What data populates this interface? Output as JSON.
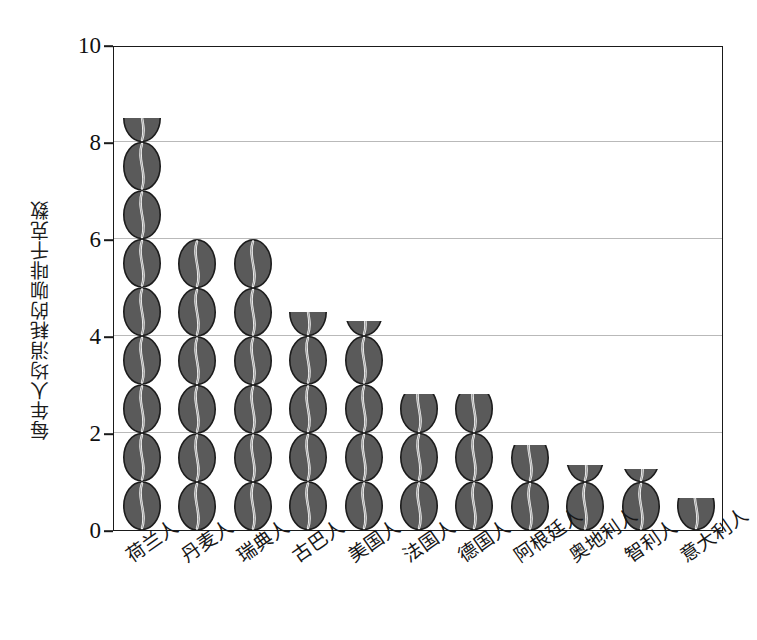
{
  "chart_data": {
    "type": "bar",
    "title": "",
    "xlabel": "",
    "ylabel": "每年人均消耗的咖啡千克数",
    "ylim": [
      0,
      10
    ],
    "ytick_labels": [
      "0",
      "2",
      "4",
      "6",
      "8",
      "10"
    ],
    "ytick_values": [
      0,
      2,
      4,
      6,
      8,
      10
    ],
    "gridlines": [
      2,
      4,
      6,
      8
    ],
    "grid": true,
    "legend": "none",
    "bar_style": "coffee-bean-pictogram",
    "unit_note": "每颗咖啡豆代表1千克",
    "categories": [
      "荷兰人",
      "丹麦人",
      "瑞典人",
      "古巴人",
      "美国人",
      "法国人",
      "德国人",
      "阿根廷人",
      "奥地利人",
      "智利人",
      "意大利人"
    ],
    "values": [
      8.5,
      6.0,
      6.0,
      4.5,
      4.3,
      2.8,
      2.8,
      1.75,
      1.35,
      1.25,
      0.65
    ],
    "colors": {
      "bean_fill": "#5a5a5a",
      "bean_outline": "#1c1c1c",
      "bean_crease": "#f2f2f2",
      "axis": "#1a1a1a",
      "gridline": "#b9b9b9",
      "background": "#ffffff"
    }
  }
}
